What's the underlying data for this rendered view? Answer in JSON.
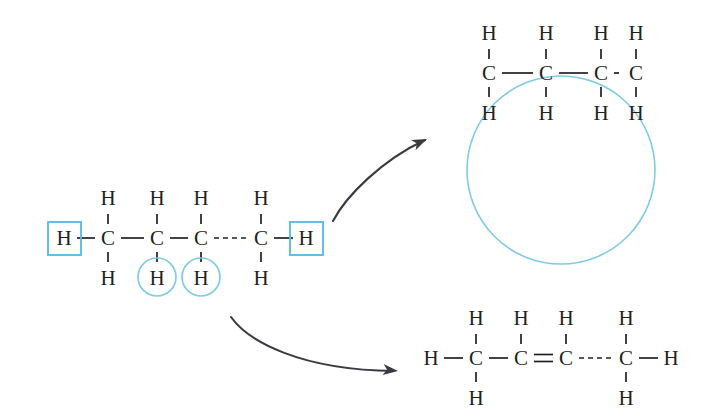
{
  "diagram": {
    "background_color": "#ffffff",
    "atom_color": "#231f20",
    "highlight_color": "#5bbce4",
    "highlight_circle_color": "#7fcbe8",
    "arrow_color": "#3a3a42",
    "labels": {
      "carbon": "C",
      "hydrogen": "H"
    }
  },
  "reactant": {
    "name": "butane-like alkane chain",
    "carbons": [
      {
        "label": "C",
        "x": 108,
        "y": 238,
        "h_top": "H",
        "h_bottom": "H"
      },
      {
        "label": "C",
        "x": 157,
        "y": 238,
        "h_top": "H",
        "h_bottom": "H"
      },
      {
        "label": "C",
        "x": 201,
        "y": 238,
        "h_top": "H",
        "h_bottom": "H"
      },
      {
        "label": "C",
        "x": 261,
        "y": 238,
        "h_top": "H",
        "h_bottom": "H"
      }
    ],
    "terminal_hydrogens": [
      {
        "label": "H",
        "x": 64,
        "y": 238,
        "side": "left",
        "highlighted": true
      },
      {
        "label": "H",
        "x": 306,
        "y": 238,
        "side": "right",
        "highlighted": true
      }
    ],
    "bonds": [
      {
        "from": 1,
        "to": 2,
        "order": 1,
        "style": "solid"
      },
      {
        "from": 2,
        "to": 3,
        "order": 1,
        "style": "solid"
      },
      {
        "from": 3,
        "to": 4,
        "order": 1,
        "style": "dashed"
      }
    ],
    "highlight_boxes": [
      {
        "x": 48,
        "y": 222,
        "size": 33,
        "target": "terminal-hydrogen-left"
      },
      {
        "x": 290,
        "y": 222,
        "size": 33,
        "target": "terminal-hydrogen-right"
      }
    ],
    "highlight_circles": [
      {
        "cx": 157,
        "cy": 277,
        "r": 19,
        "target": "hydrogen-below-c2"
      },
      {
        "cx": 201,
        "cy": 277,
        "r": 19,
        "target": "hydrogen-below-c3"
      }
    ]
  },
  "product_top": {
    "name": "cyclized product (ring closure shown by blue circle)",
    "carbons": [
      {
        "label": "C",
        "x": 489,
        "y": 73,
        "h_top": "H",
        "h_bottom": "H"
      },
      {
        "label": "C",
        "x": 546,
        "y": 73,
        "h_top": "H",
        "h_bottom": "H"
      },
      {
        "label": "C",
        "x": 601,
        "y": 73,
        "h_top": "H",
        "h_bottom": "H"
      },
      {
        "label": "C",
        "x": 636,
        "y": 73,
        "h_top": "H",
        "h_bottom": "H"
      }
    ],
    "terminal_hydrogens": [],
    "bonds": [
      {
        "from": 1,
        "to": 2,
        "order": 1,
        "style": "solid"
      },
      {
        "from": 2,
        "to": 3,
        "order": 1,
        "style": "solid"
      },
      {
        "from": 3,
        "to": 4,
        "order": 1,
        "style": "dashed"
      }
    ],
    "ring_circle": {
      "cx": 561,
      "cy": 170,
      "r": 94
    }
  },
  "product_bottom": {
    "name": "alkene product with C2=C3 double bond",
    "carbons": [
      {
        "label": "C",
        "x": 476,
        "y": 358,
        "h_top": "H",
        "h_bottom": "H"
      },
      {
        "label": "C",
        "x": 521,
        "y": 358,
        "h_top": "H",
        "h_bottom": null
      },
      {
        "label": "C",
        "x": 566,
        "y": 358,
        "h_top": "H",
        "h_bottom": null
      },
      {
        "label": "C",
        "x": 626,
        "y": 358,
        "h_top": "H",
        "h_bottom": "H"
      }
    ],
    "terminal_hydrogens": [
      {
        "label": "H",
        "x": 431,
        "y": 358,
        "side": "left",
        "highlighted": false
      },
      {
        "label": "H",
        "x": 671,
        "y": 358,
        "side": "right",
        "highlighted": false
      }
    ],
    "bonds": [
      {
        "from": 1,
        "to": 2,
        "order": 1,
        "style": "solid"
      },
      {
        "from": 2,
        "to": 3,
        "order": 2,
        "style": "solid"
      },
      {
        "from": 3,
        "to": 4,
        "order": 1,
        "style": "dashed"
      }
    ]
  },
  "arrows": [
    {
      "name": "arrow-to-cyclization-product",
      "path": "M333,221 C346,196 382,160 425,140",
      "head": {
        "x": 427,
        "y": 139,
        "angle": -24
      }
    },
    {
      "name": "arrow-to-alkene-product",
      "path": "M231,317 C248,341 300,370 394,371",
      "head": {
        "x": 398,
        "y": 371,
        "angle": 6
      }
    }
  ]
}
